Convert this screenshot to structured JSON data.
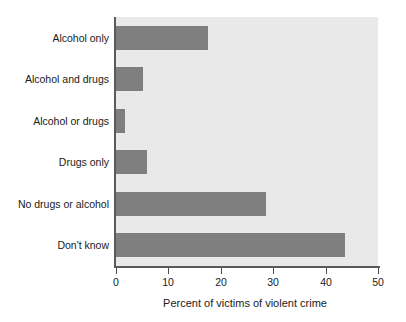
{
  "chart_data": {
    "type": "bar",
    "orientation": "horizontal",
    "title": "",
    "subtitle": "",
    "xlabel": "Percent of victims of violent crime",
    "ylabel": "",
    "categories": [
      "Alcohol only",
      "Alcohol and drugs",
      "Alcohol or drugs",
      "Drugs only",
      "No drugs or alcohol",
      "Don't know"
    ],
    "values": [
      17.6,
      5.2,
      1.7,
      5.9,
      28.6,
      43.7
    ],
    "xlim": [
      0,
      50
    ],
    "xticks": [
      "0",
      "10",
      "20",
      "30",
      "40",
      "50"
    ],
    "xtick_values": [
      0,
      10,
      20,
      30,
      40,
      50
    ],
    "grid": false,
    "legend": "none",
    "bar_color": "#7f7f7f",
    "plot_background": "#e9e9e9",
    "axis_color": "#5a5a5a",
    "figure_background": "#ffffff"
  }
}
